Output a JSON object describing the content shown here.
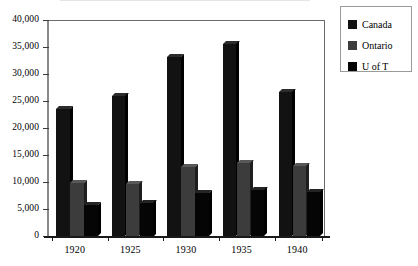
{
  "chart_data": {
    "type": "bar",
    "title": "",
    "subtitle": "",
    "xlabel": "",
    "ylabel": "",
    "categories": [
      "1920",
      "1925",
      "1930",
      "1935",
      "1940"
    ],
    "series": [
      {
        "name": "Canada",
        "color": "#121212",
        "values": [
          23500,
          26000,
          33200,
          35600,
          26700
        ]
      },
      {
        "name": "Ontario",
        "color": "#3c3c3c",
        "values": [
          9900,
          9700,
          12700,
          13500,
          12900
        ]
      },
      {
        "name": "U of T",
        "color": "#050505",
        "values": [
          5700,
          6200,
          7900,
          8500,
          8200
        ]
      }
    ],
    "ylim": [
      0,
      40000
    ],
    "ytick_step": 5000,
    "yticks": [
      0,
      5000,
      10000,
      15000,
      20000,
      25000,
      30000,
      35000,
      40000
    ],
    "ytick_labels": [
      "0",
      "5,000",
      "10,000",
      "15,000",
      "20,000",
      "25,000",
      "30,000",
      "35,000",
      "40,000"
    ],
    "grid": false,
    "legend_position": "right",
    "bar_style": "3d-clustered"
  },
  "legend": {
    "items": [
      {
        "label": "Canada",
        "swatch": "legend-swatch-canada"
      },
      {
        "label": "Ontario",
        "swatch": "legend-swatch-ontario"
      },
      {
        "label": "U of T",
        "swatch": "legend-swatch-u-of-t"
      }
    ]
  }
}
